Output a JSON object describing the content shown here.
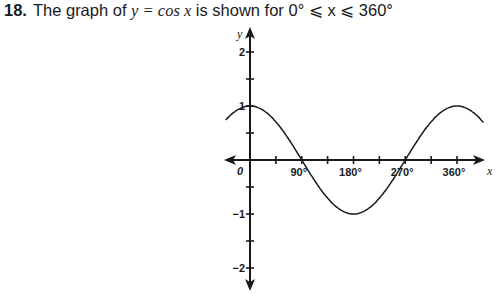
{
  "question": {
    "number": "18.",
    "text_prefix": "The graph of ",
    "equation": "y = cos x",
    "text_middle": " is shown for ",
    "domain": "0° ⩽ x ⩽ 360°"
  },
  "chart_data": {
    "type": "line",
    "xlabel": "x",
    "ylabel": "y",
    "function": "cos(x)",
    "xlim": [
      -45,
      405
    ],
    "ylim": [
      -2.4,
      2.4
    ],
    "x_ticks_step": 45,
    "x_tick_labels": [
      "0",
      "90°",
      "180°",
      "270°",
      "360°"
    ],
    "y_tick_labels": [
      "2",
      "1",
      "−1",
      "−2"
    ],
    "y_ticks_step": 0.5,
    "grid": false,
    "series": [
      {
        "name": "y = cos x",
        "x": [
          -40,
          0,
          45,
          90,
          135,
          180,
          225,
          270,
          315,
          360,
          405
        ],
        "y": [
          0.77,
          1,
          0.71,
          0,
          -0.71,
          -1,
          -0.71,
          0,
          0.71,
          1,
          0.71
        ]
      }
    ]
  }
}
